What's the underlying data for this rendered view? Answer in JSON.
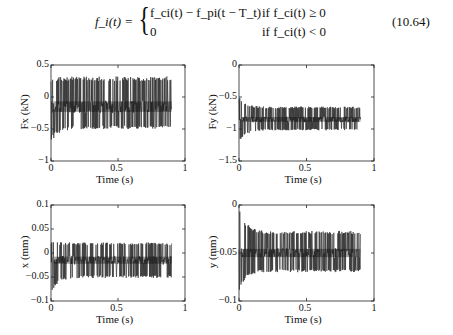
{
  "equation": {
    "lhs": "f_i(t) =",
    "case1_expr": "f_ci(t) − f_pi(t − T_t)",
    "case1_cond": "if f_ci(t) ≥ 0",
    "case2_expr": "0",
    "case2_cond": "if f_ci(t) < 0",
    "number": "(10.64)"
  },
  "chart_data": [
    {
      "type": "line",
      "title": "",
      "xlabel": "Time (s)",
      "ylabel": "Fx (kN)",
      "xlim": [
        0,
        1
      ],
      "ylim": [
        -1,
        0.5
      ],
      "xticks": [
        "0",
        "0.5",
        "1"
      ],
      "yticks": [
        "0.5",
        "0",
        "-0.5",
        "-1"
      ],
      "signal": {
        "t_end": 0.9,
        "upper": 0.32,
        "lower": -0.5,
        "mean": -0.15,
        "initial_min": -0.72,
        "initial_max": 0.12
      }
    },
    {
      "type": "line",
      "title": "",
      "xlabel": "Time (s)",
      "ylabel": "Fy (kN)",
      "xlim": [
        0,
        1
      ],
      "ylim": [
        -1.5,
        0
      ],
      "xticks": [
        "0",
        "0.5",
        "1"
      ],
      "yticks": [
        "0",
        "-0.5",
        "-1",
        "-1.5"
      ],
      "signal": {
        "t_end": 0.9,
        "upper": -0.65,
        "lower": -1.02,
        "mean": -0.85,
        "initial_min": -1.22,
        "initial_max": -0.5
      }
    },
    {
      "type": "line",
      "title": "",
      "xlabel": "Time (s)",
      "ylabel": "x (mm)",
      "xlim": [
        0,
        1
      ],
      "ylim": [
        -0.1,
        0.1
      ],
      "xticks": [
        "0",
        "0.5",
        "1"
      ],
      "yticks": [
        "0.1",
        "0.05",
        "0",
        "-0.05",
        "-0.1"
      ],
      "signal": {
        "t_end": 0.9,
        "upper": 0.022,
        "lower": -0.052,
        "mean": -0.015,
        "initial_min": -0.085,
        "initial_max": 0.03
      }
    },
    {
      "type": "line",
      "title": "",
      "xlabel": "Time (s)",
      "ylabel": "y (mm)",
      "xlim": [
        0,
        1
      ],
      "ylim": [
        -0.1,
        0
      ],
      "xticks": [
        "0",
        "0.5",
        "1"
      ],
      "yticks": [
        "0",
        "-0.05",
        "-0.1"
      ],
      "signal": {
        "t_end": 0.9,
        "upper": -0.027,
        "lower": -0.07,
        "mean": -0.05,
        "initial_min": -0.09,
        "initial_max": -0.002
      }
    }
  ]
}
